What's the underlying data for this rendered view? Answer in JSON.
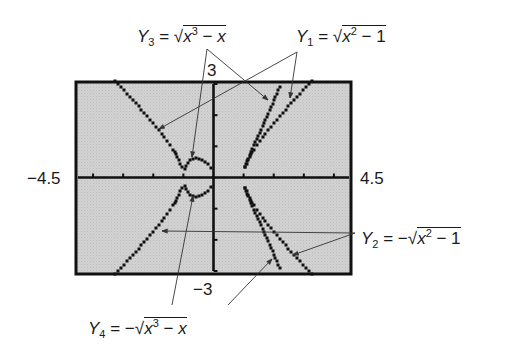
{
  "chart_data": {
    "type": "line",
    "title": "",
    "xlabel": "",
    "ylabel": "",
    "xlim": [
      -4.5,
      4.5
    ],
    "ylim": [
      -3,
      3
    ],
    "x_tick_step": 1,
    "y_tick_step": 1,
    "grid": false,
    "window_labels": {
      "xmin": "−4.5",
      "xmax": "4.5",
      "ymin": "−3",
      "ymax": "3"
    },
    "series": [
      {
        "name": "Y1 = √(x² − 1)",
        "x": [
          -4.5,
          -4,
          -3,
          -2,
          -1.5,
          -1.2,
          -1,
          1,
          1.2,
          1.5,
          2,
          3,
          4,
          4.5
        ],
        "y": [
          4.39,
          3.87,
          2.83,
          1.73,
          1.12,
          0.66,
          0,
          0,
          0.66,
          1.12,
          1.73,
          2.83,
          3.87,
          4.39
        ]
      },
      {
        "name": "Y2 = −√(x² − 1)",
        "x": [
          -4.5,
          -4,
          -3,
          -2,
          -1.5,
          -1.2,
          -1,
          1,
          1.2,
          1.5,
          2,
          3,
          4,
          4.5
        ],
        "y": [
          -4.39,
          -3.87,
          -2.83,
          -1.73,
          -1.12,
          -0.66,
          0,
          0,
          -0.66,
          -1.12,
          -1.73,
          -2.83,
          -3.87,
          -4.39
        ]
      },
      {
        "name": "Y3 = √(x³ − x)",
        "x": [
          -1,
          -0.9,
          -0.8,
          -0.577,
          -0.4,
          -0.2,
          0,
          1,
          1.2,
          1.5,
          1.8,
          2.0,
          2.2
        ],
        "y": [
          0,
          0.41,
          0.53,
          0.62,
          0.58,
          0.44,
          0,
          0,
          0.85,
          1.37,
          2.1,
          2.45,
          3.0
        ]
      },
      {
        "name": "Y4 = −√(x³ − x)",
        "x": [
          -1,
          -0.9,
          -0.8,
          -0.577,
          -0.4,
          -0.2,
          0,
          1,
          1.2,
          1.5,
          1.8,
          2.0,
          2.2
        ],
        "y": [
          0,
          -0.41,
          -0.53,
          -0.62,
          -0.58,
          -0.44,
          0,
          0,
          -0.85,
          -1.37,
          -2.1,
          -2.45,
          -3.0
        ]
      }
    ],
    "annotations": [
      {
        "label": "Y3 = √(x³ − x)",
        "position": "top-left"
      },
      {
        "label": "Y1 = √(x² − 1)",
        "position": "top-right"
      },
      {
        "label": "Y2 = −√(x² − 1)",
        "position": "right"
      },
      {
        "label": "Y4 = −√(x³ − x)",
        "position": "bottom"
      }
    ]
  },
  "labels": {
    "xmin": "−4.5",
    "xmax": "4.5",
    "ymax": "3",
    "ymin": "−3"
  },
  "equations": {
    "y3": {
      "name": "Y",
      "sub": "3",
      "eq": " = ",
      "neg": "",
      "radical": "√",
      "x1": "x",
      "pow": "3",
      "rest": " − ",
      "x2": "x"
    },
    "y1": {
      "name": "Y",
      "sub": "1",
      "eq": " = ",
      "neg": "",
      "radical": "√",
      "x1": "x",
      "pow": "2",
      "rest": " − 1"
    },
    "y2": {
      "name": "Y",
      "sub": "2",
      "eq": " = ",
      "neg": "−",
      "radical": "√",
      "x1": "x",
      "pow": "2",
      "rest": " − 1"
    },
    "y4": {
      "name": "Y",
      "sub": "4",
      "eq": " = ",
      "neg": "−",
      "radical": "√",
      "x1": "x",
      "pow": "3",
      "rest": " − ",
      "x2": "x"
    }
  }
}
